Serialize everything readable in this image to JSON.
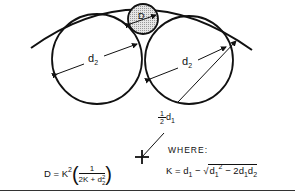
{
  "diagram": {
    "labels": {
      "small_circle": "D",
      "left_circle_diameter": "d",
      "left_circle_diameter_sub": "2",
      "right_circle_diameter": "d",
      "right_circle_diameter_sub": "2",
      "half_num": "1",
      "half_den": "2",
      "half_var": "d",
      "half_sub": "1"
    },
    "where_label": "WHERE:",
    "formula_D": {
      "lhs": "D = K",
      "exp": "2",
      "num": "1",
      "den_a": "2K + d",
      "den_sup": "2",
      "den_sub": "2"
    },
    "formula_K": {
      "lhs": "K = d",
      "sub1": "1",
      "minus": " − ",
      "radical": "√",
      "rad_a": "d",
      "rad_a_sub": "1",
      "rad_a_sup": "2",
      "rad_b": " − 2d",
      "rad_b_sub1": "1",
      "rad_b_var": "d",
      "rad_b_sub2": "2"
    },
    "colors": {
      "stroke": "#111111",
      "fill_small": "#d0d0d0"
    }
  }
}
